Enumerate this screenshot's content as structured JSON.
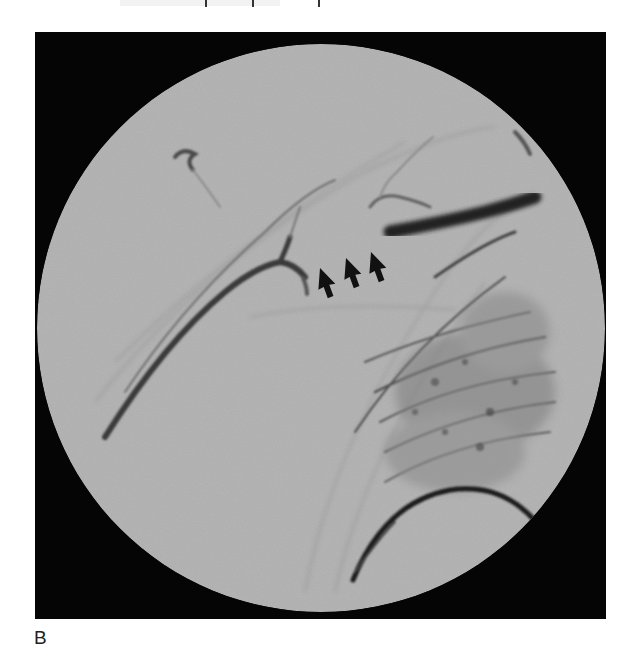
{
  "figure": {
    "panel_label": "B",
    "image_description": "Circular-field fluoroscopic angiogram (grayscale) of the shoulder/upper chest region showing opacified vessels; three black arrows indicate a vessel segment.",
    "frame": {
      "x": 35,
      "y": 32,
      "width": 571,
      "height": 587,
      "color": "#050505"
    },
    "field_of_view": {
      "shape": "circle",
      "center_x": 286,
      "center_y": 296,
      "radius": 284,
      "fill": "#b4b4b4"
    },
    "annotations": [
      {
        "type": "arrow",
        "direction": "up-left",
        "tip": [
          320,
          268
        ],
        "tail": [
          330,
          298
        ],
        "color": "#111111"
      },
      {
        "type": "arrow",
        "direction": "up-left",
        "tip": [
          346,
          258
        ],
        "tail": [
          357,
          290
        ],
        "color": "#111111"
      },
      {
        "type": "arrow",
        "direction": "up-left",
        "tip": [
          371,
          252
        ],
        "tail": [
          383,
          283
        ],
        "color": "#111111"
      }
    ]
  }
}
